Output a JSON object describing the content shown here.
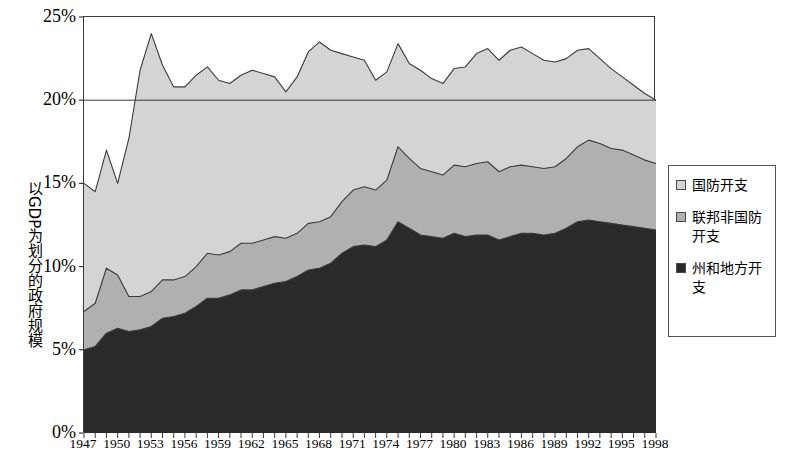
{
  "chart_data": {
    "type": "area",
    "stacked": true,
    "title": "",
    "xlabel": "",
    "ylabel": "以GDP为划分的政府规模",
    "ylim": [
      0,
      25
    ],
    "xlim": [
      1947,
      1998
    ],
    "ytick_labels": [
      "0%",
      "5%",
      "10%",
      "15%",
      "20%",
      "25%"
    ],
    "ytick_values": [
      0,
      5,
      10,
      15,
      20,
      25
    ],
    "gridlines": [
      "20%"
    ],
    "grid": false,
    "legend_position": "right",
    "x": [
      1947,
      1948,
      1949,
      1950,
      1951,
      1952,
      1953,
      1954,
      1955,
      1956,
      1957,
      1958,
      1959,
      1960,
      1961,
      1962,
      1963,
      1964,
      1965,
      1966,
      1967,
      1968,
      1969,
      1970,
      1971,
      1972,
      1973,
      1974,
      1975,
      1976,
      1977,
      1978,
      1979,
      1980,
      1981,
      1982,
      1983,
      1984,
      1985,
      1986,
      1987,
      1988,
      1989,
      1990,
      1991,
      1992,
      1993,
      1994,
      1995,
      1996,
      1997,
      1998
    ],
    "xtick_labels": [
      "1947",
      "1950",
      "1953",
      "1956",
      "1959",
      "1962",
      "1965",
      "1968",
      "1971",
      "1974",
      "1977",
      "1980",
      "1983",
      "1986",
      "1989",
      "1992",
      "1995",
      "1998"
    ],
    "series": [
      {
        "name": "州和地方开支",
        "color": "#2a2a2a",
        "values": [
          5.0,
          5.2,
          6.0,
          6.3,
          6.1,
          6.2,
          6.4,
          6.9,
          7.0,
          7.2,
          7.6,
          8.1,
          8.1,
          8.3,
          8.6,
          8.6,
          8.8,
          9.0,
          9.1,
          9.4,
          9.8,
          9.9,
          10.2,
          10.8,
          11.2,
          11.3,
          11.2,
          11.6,
          12.7,
          12.3,
          11.9,
          11.8,
          11.7,
          12.0,
          11.8,
          11.9,
          11.9,
          11.6,
          11.8,
          12.0,
          12.0,
          11.9,
          12.0,
          12.3,
          12.7,
          12.8,
          12.7,
          12.6,
          12.5,
          12.4,
          12.3,
          12.2
        ]
      },
      {
        "name": "联邦非国防开支",
        "color": "#b0b0b0",
        "values": [
          2.3,
          2.6,
          3.9,
          3.2,
          2.1,
          2.0,
          2.1,
          2.3,
          2.2,
          2.2,
          2.4,
          2.7,
          2.6,
          2.6,
          2.8,
          2.8,
          2.8,
          2.8,
          2.6,
          2.6,
          2.8,
          2.8,
          2.8,
          3.1,
          3.4,
          3.5,
          3.4,
          3.6,
          4.5,
          4.2,
          4.0,
          3.9,
          3.8,
          4.1,
          4.2,
          4.3,
          4.4,
          4.1,
          4.2,
          4.1,
          4.0,
          4.0,
          4.0,
          4.2,
          4.5,
          4.8,
          4.7,
          4.5,
          4.5,
          4.3,
          4.1,
          4.0
        ]
      },
      {
        "name": "国防开支",
        "color": "#d4d4d4",
        "values": [
          7.7,
          6.7,
          7.1,
          5.5,
          9.5,
          13.6,
          15.5,
          12.9,
          11.6,
          11.4,
          11.5,
          11.2,
          10.5,
          10.1,
          10.1,
          10.4,
          10.0,
          9.6,
          8.8,
          9.4,
          10.3,
          10.8,
          10.0,
          8.9,
          8.0,
          7.6,
          6.6,
          6.5,
          6.2,
          5.7,
          5.9,
          5.6,
          5.5,
          5.8,
          6.0,
          6.6,
          6.8,
          6.7,
          7.0,
          7.1,
          6.8,
          6.5,
          6.3,
          6.0,
          5.8,
          5.5,
          5.1,
          4.8,
          4.4,
          4.2,
          4.0,
          3.8
        ]
      }
    ],
    "legend_entries": [
      {
        "label": "国防开支",
        "color": "#d4d4d4"
      },
      {
        "label": "联邦非国防开支",
        "color": "#b0b0b0"
      },
      {
        "label": "州和地方开支",
        "color": "#2a2a2a"
      }
    ]
  },
  "axis": {
    "y_title": "以GDP为划分的政府规模"
  }
}
